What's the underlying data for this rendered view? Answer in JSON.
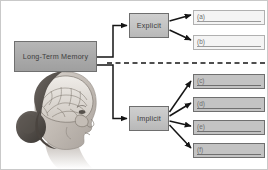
{
  "diagram": {
    "root": {
      "label": "Long-Term Memory"
    },
    "branches": [
      {
        "id": "explicit",
        "label": "Explicit"
      },
      {
        "id": "implicit",
        "label": "Implicit"
      }
    ],
    "leaves": [
      {
        "id": "a",
        "label": "(a)",
        "parent": "explicit",
        "style": "light"
      },
      {
        "id": "b",
        "label": "(b)",
        "parent": "explicit",
        "style": "light"
      },
      {
        "id": "c",
        "label": "(c)",
        "parent": "implicit",
        "style": "dark"
      },
      {
        "id": "d",
        "label": "(d)",
        "parent": "implicit",
        "style": "dark"
      },
      {
        "id": "e",
        "label": "(e)",
        "parent": "implicit",
        "style": "dark"
      },
      {
        "id": "f",
        "label": "(f)",
        "parent": "implicit",
        "style": "dark"
      }
    ],
    "divider": {
      "style": "dashed",
      "orientation": "horizontal"
    },
    "illustration": {
      "name": "head-brain-profile",
      "description": "grayscale profile of a woman's head showing the brain"
    },
    "colors": {
      "root_fill": "#a9a9a9",
      "branch_fill": "#c2c2c2",
      "leaf_light_fill": "#f4f4f4",
      "leaf_dark_fill": "#c3c3c3",
      "line": "#1a1a1a",
      "border": "#707070",
      "text": "#3a3a3a"
    }
  }
}
